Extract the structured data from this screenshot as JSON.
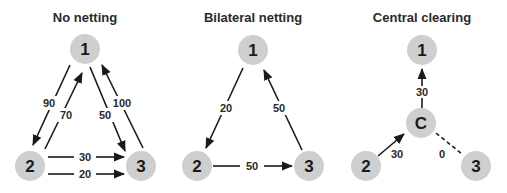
{
  "panels": [
    {
      "id": "no-netting",
      "title": "No netting",
      "nodes": [
        {
          "id": "1",
          "label": "1"
        },
        {
          "id": "2",
          "label": "2"
        },
        {
          "id": "3",
          "label": "3"
        }
      ],
      "edges": [
        {
          "from": "1",
          "to": "2",
          "label": "90"
        },
        {
          "from": "2",
          "to": "1",
          "label": "70"
        },
        {
          "from": "1",
          "to": "3",
          "label": "50"
        },
        {
          "from": "3",
          "to": "1",
          "label": "100"
        },
        {
          "from": "2",
          "to": "3",
          "label": "30"
        },
        {
          "from": "2",
          "to": "3",
          "label": "20"
        }
      ]
    },
    {
      "id": "bilateral-netting",
      "title": "Bilateral netting",
      "nodes": [
        {
          "id": "1",
          "label": "1"
        },
        {
          "id": "2",
          "label": "2"
        },
        {
          "id": "3",
          "label": "3"
        }
      ],
      "edges": [
        {
          "from": "1",
          "to": "2",
          "label": "20"
        },
        {
          "from": "3",
          "to": "1",
          "label": "50"
        },
        {
          "from": "2",
          "to": "3",
          "label": "50"
        }
      ]
    },
    {
      "id": "central-clearing",
      "title": "Central clearing",
      "nodes": [
        {
          "id": "1",
          "label": "1"
        },
        {
          "id": "C",
          "label": "C"
        },
        {
          "id": "2",
          "label": "2"
        },
        {
          "id": "3",
          "label": "3"
        }
      ],
      "edges": [
        {
          "from": "C",
          "to": "1",
          "label": "30"
        },
        {
          "from": "2",
          "to": "C",
          "label": "30"
        },
        {
          "from": "3",
          "to": "C",
          "label": "0",
          "style": "dashed"
        }
      ]
    }
  ]
}
